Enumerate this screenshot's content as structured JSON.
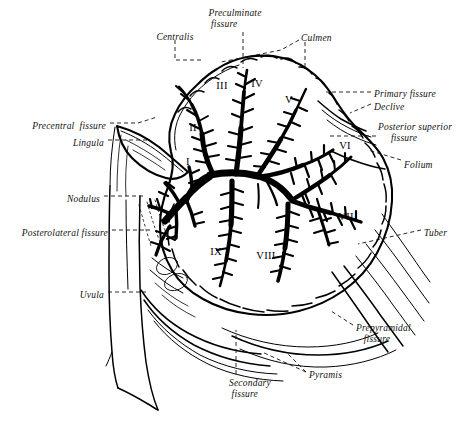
{
  "figure": {
    "ink_color": "#000000",
    "background_color": "#ffffff",
    "leader_style": "dashed"
  },
  "labels": [
    {
      "id": "centralis",
      "text": "Centralis",
      "x": 175,
      "y": 32,
      "align": "center"
    },
    {
      "id": "preculminate-fissure",
      "text": "Preculminate\n fissure",
      "x": 235,
      "y": 8,
      "align": "center"
    },
    {
      "id": "culmen",
      "text": "Culmen",
      "x": 301,
      "y": 33,
      "align": "left"
    },
    {
      "id": "primary-fissure",
      "text": "Primary fissure",
      "x": 374,
      "y": 89,
      "align": "left"
    },
    {
      "id": "declive",
      "text": "Declive",
      "x": 374,
      "y": 102,
      "align": "left"
    },
    {
      "id": "posterior-superior-fissure",
      "text": "Posterior superior\n     fissure",
      "x": 378,
      "y": 122,
      "align": "left"
    },
    {
      "id": "folium",
      "text": "Folium",
      "x": 404,
      "y": 160,
      "align": "left"
    },
    {
      "id": "tuber",
      "text": "Tuber",
      "x": 424,
      "y": 228,
      "align": "left"
    },
    {
      "id": "prepyramidal-fissure",
      "text": "Prepyramidal\n   fissure",
      "x": 356,
      "y": 323,
      "align": "left"
    },
    {
      "id": "pyramis",
      "text": "Pyramis",
      "x": 309,
      "y": 370,
      "align": "left"
    },
    {
      "id": "secondary-fissure",
      "text": "Secondary\n fissure",
      "x": 229,
      "y": 378,
      "align": "left"
    },
    {
      "id": "uvula",
      "text": "Uvula",
      "x": 104,
      "y": 290,
      "align": "right"
    },
    {
      "id": "posterolateral-fissure",
      "text": "Posterolateral fissure",
      "x": 108,
      "y": 228,
      "align": "right"
    },
    {
      "id": "nodulus",
      "text": "Nodulus",
      "x": 100,
      "y": 194,
      "align": "right"
    },
    {
      "id": "lingula",
      "text": "Lingula",
      "x": 104,
      "y": 138,
      "align": "right"
    },
    {
      "id": "precentral-fissure",
      "text": "Precentral  fissure",
      "x": 106,
      "y": 121,
      "align": "right"
    }
  ],
  "lobule_numerals": [
    {
      "id": "lobule-1",
      "text": "I",
      "x": 188,
      "y": 156
    },
    {
      "id": "lobule-2",
      "text": "II",
      "x": 193,
      "y": 122
    },
    {
      "id": "lobule-3",
      "text": "III",
      "x": 222,
      "y": 80
    },
    {
      "id": "lobule-4",
      "text": "IV",
      "x": 257,
      "y": 78
    },
    {
      "id": "lobule-5",
      "text": "V",
      "x": 289,
      "y": 94
    },
    {
      "id": "lobule-6",
      "text": "VI",
      "x": 345,
      "y": 140
    },
    {
      "id": "lobule-7",
      "text": "VII",
      "x": 346,
      "y": 211
    },
    {
      "id": "lobule-8",
      "text": "VIII",
      "x": 266,
      "y": 250
    },
    {
      "id": "lobule-9",
      "text": "IX",
      "x": 216,
      "y": 246
    },
    {
      "id": "lobule-10",
      "text": "X",
      "x": 186,
      "y": 195
    }
  ]
}
